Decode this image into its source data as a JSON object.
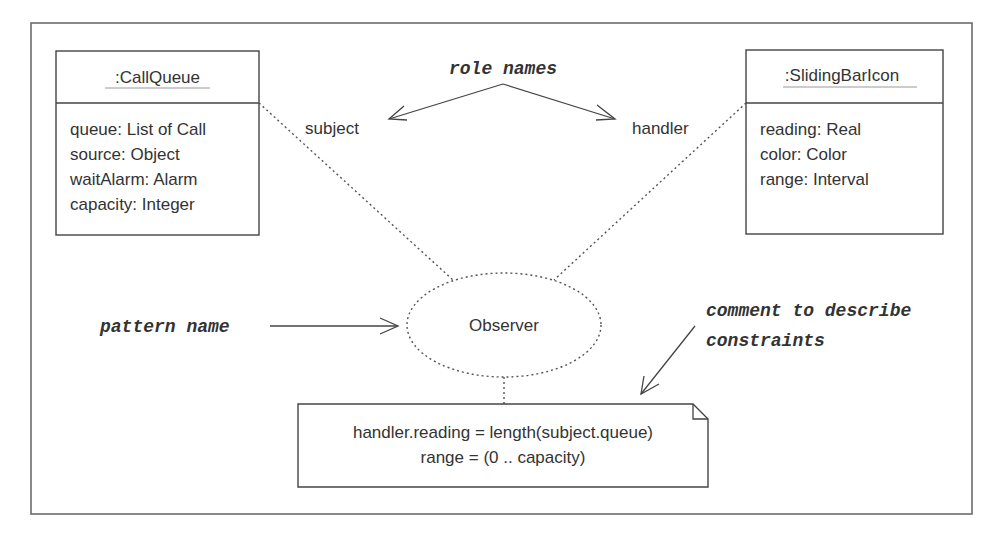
{
  "diagram": {
    "type": "UML collaboration diagram (Observer pattern)",
    "objects": [
      {
        "id": "callqueue",
        "name": ":CallQueue",
        "attributes": [
          "queue: List of Call",
          "source: Object",
          "waitAlarm: Alarm",
          "capacity: Integer"
        ]
      },
      {
        "id": "slidingbaricon",
        "name": ":SlidingBarIcon",
        "attributes": [
          "reading: Real",
          "color: Color",
          "range: Interval"
        ]
      }
    ],
    "collaboration": {
      "name": "Observer"
    },
    "roles": {
      "subject": "subject",
      "handler": "handler"
    },
    "constraint_note": {
      "lines": [
        "handler.reading = length(subject.queue)",
        "range = (0 .. capacity)"
      ]
    },
    "annotations": {
      "role_names": "role names",
      "pattern_name": "pattern name",
      "comment_line1": "comment to describe",
      "comment_line2": "constraints"
    }
  }
}
